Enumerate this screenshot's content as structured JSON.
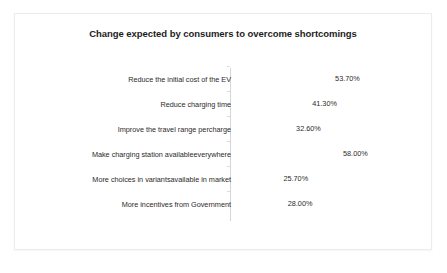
{
  "chart_data": {
    "type": "bar",
    "orientation": "horizontal",
    "title": "Change expected by consumers to overcome shortcomings",
    "xlabel": "",
    "ylabel": "",
    "grid": false,
    "legend": null,
    "xlim": [
      0,
      58
    ],
    "value_suffix": "%",
    "categories": [
      "Reduce the initial cost of the EV",
      "Reduce charging time",
      "Improve the travel range percharge",
      "Make charging station availableeverywhere",
      "More choices in variantsavailable in market",
      "More incentives from Government"
    ],
    "values": [
      53.7,
      41.3,
      32.6,
      58.0,
      25.7,
      28.0
    ],
    "value_labels": [
      "53.70%",
      "41.30%",
      "32.60%",
      "58.00%",
      "25.70%",
      "28.00%"
    ],
    "bar_color": "#c9c9c9",
    "text_color": "#2b2b2b",
    "background_color": "#ffffff"
  }
}
